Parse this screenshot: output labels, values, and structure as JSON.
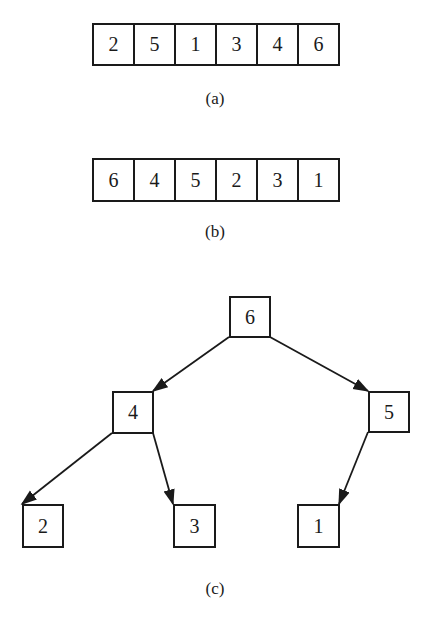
{
  "arrays": [
    {
      "id": "a",
      "caption": "(a)",
      "values": [
        "2",
        "5",
        "1",
        "3",
        "4",
        "6"
      ]
    },
    {
      "id": "b",
      "caption": "(b)",
      "values": [
        "6",
        "4",
        "5",
        "2",
        "3",
        "1"
      ]
    }
  ],
  "tree": {
    "caption": "(c)",
    "nodes": [
      {
        "id": "n6",
        "label": "6"
      },
      {
        "id": "n4",
        "label": "4"
      },
      {
        "id": "n5",
        "label": "5"
      },
      {
        "id": "n2",
        "label": "2"
      },
      {
        "id": "n3",
        "label": "3"
      },
      {
        "id": "n1",
        "label": "1"
      }
    ],
    "edges": [
      {
        "from": "6",
        "to": "4"
      },
      {
        "from": "6",
        "to": "5"
      },
      {
        "from": "4",
        "to": "2"
      },
      {
        "from": "4",
        "to": "3"
      },
      {
        "from": "5",
        "to": "1"
      }
    ]
  },
  "colors": {
    "ink": "#1a1a1a",
    "background": "#ffffff"
  }
}
